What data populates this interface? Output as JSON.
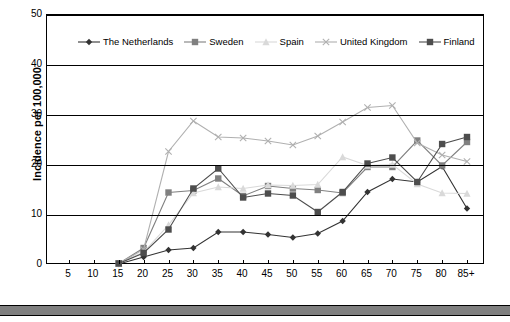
{
  "chart_data": {
    "type": "line",
    "title": "",
    "xlabel": "",
    "ylabel": "Incidence per 100,000",
    "xlim": [
      0,
      18
    ],
    "ylim": [
      0,
      50
    ],
    "yticks": [
      0,
      10,
      20,
      30,
      40,
      50
    ],
    "grid": true,
    "legend_position": "top-inside",
    "categories": [
      "5",
      "10",
      "15",
      "20",
      "25",
      "30",
      "35",
      "40",
      "45",
      "50",
      "55",
      "60",
      "65",
      "70",
      "75",
      "80",
      "85+"
    ],
    "series": [
      {
        "name": "The Netherlands",
        "marker": "diamond",
        "color": "#333333",
        "values": [
          null,
          null,
          0.2,
          1.6,
          3.0,
          3.4,
          6.6,
          6.6,
          6.1,
          5.5,
          6.3,
          8.8,
          14.6,
          17.2,
          16.6,
          19.7,
          11.3
        ]
      },
      {
        "name": "Sweden",
        "marker": "square",
        "color": "#808080",
        "values": [
          null,
          null,
          0.3,
          3.4,
          14.5,
          14.9,
          17.3,
          13.8,
          15.8,
          15.3,
          15.0,
          14.4,
          19.6,
          19.6,
          24.9,
          19.9,
          24.6
        ]
      },
      {
        "name": "Spain",
        "marker": "triangle",
        "color": "#d9d9d9",
        "values": [
          null,
          null,
          0.3,
          2.6,
          8.0,
          14.4,
          15.6,
          15.3,
          16.0,
          15.9,
          16.1,
          21.6,
          19.9,
          20.1,
          16.2,
          14.4,
          14.3
        ]
      },
      {
        "name": "United Kingdom",
        "marker": "cross",
        "color": "#b0b0b0",
        "values": [
          null,
          null,
          0.3,
          3.1,
          22.7,
          28.8,
          25.6,
          25.4,
          24.8,
          24.0,
          25.8,
          28.6,
          31.5,
          31.9,
          24.4,
          22.0,
          20.7
        ]
      },
      {
        "name": "Finland",
        "marker": "square-dark",
        "color": "#4d4d4d",
        "values": [
          null,
          null,
          0.3,
          2.4,
          7.1,
          15.3,
          19.3,
          13.5,
          14.3,
          13.9,
          10.6,
          14.6,
          20.3,
          21.5,
          16.6,
          24.2,
          25.6
        ]
      }
    ]
  }
}
